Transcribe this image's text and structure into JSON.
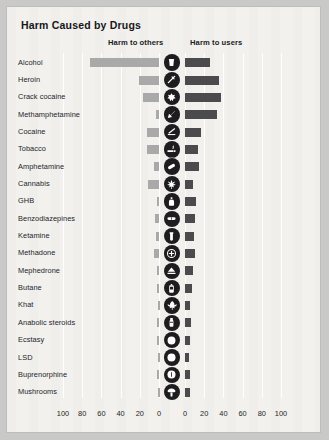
{
  "title": "Harm Caused by Drugs",
  "legend": {
    "others": "Harm to others",
    "users": "Harm to users"
  },
  "colors": {
    "page_background": "#f2f1ee",
    "outer_background": "#c9c9c7",
    "bar_others": "#a9a9a9",
    "bar_users": "#4b4b4d",
    "icon_background": "#1d1d1f",
    "icon_glyph": "#ffffff",
    "gridline": "#ffffff",
    "text": "#1e1e22"
  },
  "axis": {
    "left_ticks": [
      "100",
      "80",
      "60",
      "40",
      "20",
      "0"
    ],
    "right_ticks": [
      "0",
      "20",
      "40",
      "60",
      "80",
      "100"
    ],
    "max": 100,
    "step": 20
  },
  "chart_data": {
    "type": "bar",
    "title": "Harm Caused by Drugs",
    "orientation": "horizontal-diverging",
    "xlabel": "",
    "ylabel": "",
    "xlim": [
      0,
      100
    ],
    "grid": true,
    "legend_position": "top",
    "categories": [
      "Alcohol",
      "Heroin",
      "Crack cocaine",
      "Methamphetamine",
      "Cocaine",
      "Tobacco",
      "Amphetamine",
      "Cannabis",
      "GHB",
      "Benzodiazepines",
      "Ketamine",
      "Methadone",
      "Mephedrone",
      "Butane",
      "Khat",
      "Anabolic steroids",
      "Ecstasy",
      "LSD",
      "Buprenorphine",
      "Mushrooms"
    ],
    "series": [
      {
        "name": "Harm to others",
        "direction": "left",
        "color": "#a9a9a9",
        "values": [
          72,
          21,
          17,
          3,
          12,
          12,
          5,
          11,
          2,
          4,
          3,
          5,
          2,
          2,
          1,
          2,
          2,
          1,
          2,
          1
        ]
      },
      {
        "name": "Harm to users",
        "direction": "right",
        "color": "#4b4b4d",
        "values": [
          26,
          35,
          37,
          33,
          17,
          14,
          15,
          8,
          11,
          10,
          9,
          10,
          8,
          7,
          5,
          6,
          5,
          4,
          5,
          5
        ]
      }
    ],
    "icons": [
      "beer-glass-icon",
      "syringe-icon",
      "crack-rock-icon",
      "crystal-shard-icon",
      "cocaine-line-icon",
      "cigarette-icon",
      "pill-capsule-icon",
      "cannabis-leaf-icon",
      "ghb-bottle-icon",
      "benzodiazepine-pill-icon",
      "ketamine-vial-icon",
      "methadone-cross-icon",
      "mephedrone-powder-icon",
      "butane-canister-icon",
      "khat-leaf-icon",
      "steroid-ampoule-icon",
      "ecstasy-tablet-icon",
      "lsd-tab-icon",
      "buprenorphine-tablet-icon",
      "mushroom-icon"
    ]
  }
}
